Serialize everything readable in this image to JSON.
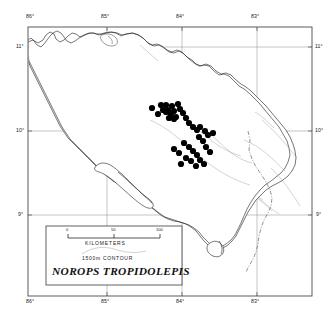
{
  "figure": {
    "type": "distribution-map",
    "species": "NOROPS TROPIDOLEPIS",
    "region": "Costa Rica and western Panama / southern Nicaragua",
    "background_color": "#ffffff",
    "frame_color": "#555555"
  },
  "axes": {
    "longitude_top": [
      "86°",
      "85°",
      "84°",
      "83°"
    ],
    "longitude_bottom": [
      "86°",
      "85°",
      "84°",
      "83°"
    ],
    "latitude_left": [
      "11°",
      "10°",
      "9°"
    ],
    "latitude_right": [
      "11°",
      "10°",
      "9°"
    ]
  },
  "legend": {
    "scale_ticks": [
      "0",
      "50",
      "100"
    ],
    "scale_units": "KILOMETERS",
    "contour_label": "1500m CONTOUR",
    "species_label": "NOROPS TROPIDOLEPIS"
  },
  "symbols": {
    "locality_dot": "filled-circle",
    "locality_dot_color": "#000000"
  },
  "chart_data": {
    "type": "scatter",
    "title": "NOROPS TROPIDOLEPIS",
    "xlabel": "Longitude (°W)",
    "ylabel": "Latitude (°N)",
    "xlim": [
      86.3,
      82.5
    ],
    "ylim": [
      8.3,
      11.4
    ],
    "grid": true,
    "legend_position": "lower-left",
    "points_px": [
      [
        152,
        108
      ],
      [
        161,
        105
      ],
      [
        166,
        105
      ],
      [
        168,
        110
      ],
      [
        172,
        106
      ],
      [
        174,
        111
      ],
      [
        178,
        104
      ],
      [
        180,
        109
      ],
      [
        183,
        113
      ],
      [
        176,
        117
      ],
      [
        171,
        114
      ],
      [
        166,
        112
      ],
      [
        163,
        110
      ],
      [
        158,
        114
      ],
      [
        169,
        118
      ],
      [
        174,
        119
      ],
      [
        186,
        118
      ],
      [
        189,
        123
      ],
      [
        193,
        127
      ],
      [
        197,
        130
      ],
      [
        200,
        127
      ],
      [
        205,
        131
      ],
      [
        208,
        135
      ],
      [
        213,
        133
      ],
      [
        199,
        137
      ],
      [
        203,
        141
      ],
      [
        184,
        143
      ],
      [
        189,
        147
      ],
      [
        174,
        149
      ],
      [
        179,
        153
      ],
      [
        193,
        151
      ],
      [
        197,
        155
      ],
      [
        206,
        147
      ],
      [
        210,
        152
      ],
      [
        186,
        158
      ],
      [
        191,
        161
      ],
      [
        200,
        160
      ],
      [
        204,
        164
      ],
      [
        196,
        166
      ],
      [
        181,
        164
      ]
    ]
  }
}
